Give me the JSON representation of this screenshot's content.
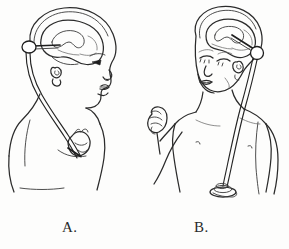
{
  "figure": {
    "kind": "medical-line-drawing",
    "title": "",
    "background_color": "#fdfdfc",
    "ink_color": "#2b2b2b",
    "width": 289,
    "height": 249,
    "panels": [
      {
        "id": "A",
        "caption": "A.",
        "view": "lateral profile of infant head and upper torso, facing right",
        "shunt_type": "ventriculoatrial shunt",
        "elements": [
          "skull outline",
          "brain and lateral ventricle outline",
          "ventricular catheter",
          "shunt reservoir oval behind ear",
          "ear",
          "facial profile with eye, nose, lips, chin",
          "neck",
          "distal catheter tubing down neck",
          "chest with catheter entering at heart",
          "shoulder and upper arm"
        ]
      },
      {
        "id": "B",
        "caption": "B.",
        "view": "anterior view of infant head and torso, head tilted",
        "shunt_type": "ventriculoperitoneal shunt",
        "elements": [
          "skull outline",
          "brain and lateral ventricle outline",
          "ventricular catheter",
          "round shunt reservoir behind ear",
          "ear",
          "face with closed eyes, nose, mouth",
          "neck and shoulders",
          "raised clenched fist on left arm",
          "right arm",
          "chest with nipples",
          "distal catheter tubing down chest",
          "coiled peritoneal catheter tip"
        ]
      }
    ]
  },
  "captions": {
    "panel_a": "A.",
    "panel_b": "B."
  }
}
